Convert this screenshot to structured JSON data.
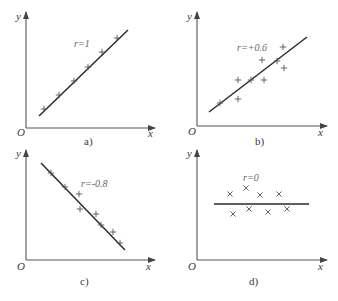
{
  "figure": {
    "origin_label": "O",
    "x_axis_label": "x",
    "y_axis_label": "y"
  },
  "chart_data": [
    {
      "type": "scatter",
      "panel": "a)",
      "caption": "a)",
      "annotation": "r=1",
      "marker": "plus",
      "xlabel": "x",
      "ylabel": "y",
      "origin": "O",
      "grid": false,
      "trend_line": {
        "from": [
          39,
          116
        ],
        "to": [
          128,
          30
        ]
      },
      "points": [
        [
          44,
          109
        ],
        [
          59,
          95
        ],
        [
          74,
          81
        ],
        [
          88,
          67
        ],
        [
          102,
          52
        ],
        [
          117,
          38
        ]
      ]
    },
    {
      "type": "scatter",
      "panel": "b)",
      "caption": "b)",
      "annotation": "r=+0.6",
      "marker": "plus",
      "xlabel": "x",
      "ylabel": "y",
      "origin": "O",
      "grid": false,
      "trend_line": {
        "from": [
          209,
          112
        ],
        "to": [
          307,
          37
        ]
      },
      "points": [
        [
          220,
          103
        ],
        [
          238,
          99
        ],
        [
          238,
          80
        ],
        [
          251,
          80
        ],
        [
          264,
          80
        ],
        [
          262,
          60
        ],
        [
          277,
          61
        ],
        [
          283,
          47
        ],
        [
          284,
          68
        ]
      ]
    },
    {
      "type": "scatter",
      "panel": "c)",
      "caption": "c)",
      "annotation": "r=-0.8",
      "marker": "plus",
      "xlabel": "x",
      "ylabel": "y",
      "origin": "O",
      "grid": false,
      "trend_line": {
        "from": [
          41,
          163
        ],
        "to": [
          125,
          250
        ]
      },
      "points": [
        [
          51,
          173
        ],
        [
          65,
          187
        ],
        [
          79,
          194
        ],
        [
          80,
          209
        ],
        [
          96,
          214
        ],
        [
          101,
          225
        ],
        [
          113,
          232
        ],
        [
          120,
          243
        ]
      ]
    },
    {
      "type": "scatter",
      "panel": "d)",
      "caption": "d)",
      "annotation": "r=0",
      "marker": "cross",
      "xlabel": "x",
      "ylabel": "y",
      "origin": "O",
      "grid": false,
      "trend_line": {
        "from": [
          214,
          204
        ],
        "to": [
          309,
          204
        ]
      },
      "points": [
        [
          230,
          194
        ],
        [
          246,
          188
        ],
        [
          260,
          195
        ],
        [
          279,
          194
        ],
        [
          233,
          214
        ],
        [
          249,
          209
        ],
        [
          268,
          212
        ],
        [
          287,
          209
        ]
      ]
    }
  ]
}
